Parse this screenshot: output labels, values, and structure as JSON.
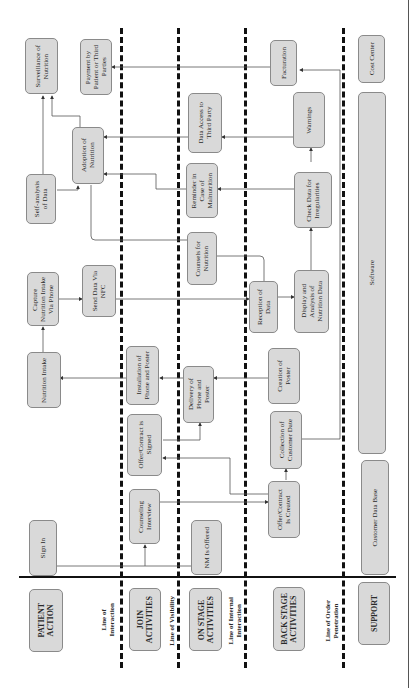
{
  "diagram": {
    "type": "service-blueprint",
    "orientation": "rotated-90-ccw",
    "lanes": [
      {
        "id": "patient",
        "label": "PATIENT\nACTION"
      },
      {
        "id": "join",
        "label": "JOIN\nACTIVITIES"
      },
      {
        "id": "onstage",
        "label": "ON STAGE\nACTIVITIES"
      },
      {
        "id": "backstage",
        "label": "BACK STAGE\nACTIVITIES"
      },
      {
        "id": "support",
        "label": "SUPPORT"
      }
    ],
    "lines": [
      {
        "label": "Line of\nInteraction"
      },
      {
        "label": "Line of Visibility"
      },
      {
        "label": "Line of Internal\nInteraction"
      },
      {
        "label": "Line of Order\nPenetration"
      }
    ],
    "nodes": {
      "sign_in": "Sign In",
      "nutrition_intake": "Nutrition Intake",
      "capture_intake": "Capture\nNutrition Intake\nVia Phone",
      "self_analysis": "Self-analysis\nof Data",
      "surveillance": "Surveillance of\nNutrition",
      "counseling_interview": "Counseling\nInterview",
      "offer_signed": "Offer/Contract is\nSigned",
      "installation": "Installation of\nPhone and Poster",
      "send_nfc": "Send Data Via\nNFC",
      "adoption": "Adoption of\nNutrition",
      "payment": "Payment by\nPatient or Third\nParties",
      "nm_offered": "NM Is Offered",
      "delivery": "Delivery of\nPhone and\nPoster",
      "counsels": "Counsels for\nNutrition",
      "reminder": "Reminder in\nCase of\nMalnutrition",
      "data_access": "Data Access to\nThird Party",
      "offer_created": "Offer/Contract\nIs Created",
      "collection": "Collection of\nCustomer Date",
      "creation_poster": "Creation of\nPoster",
      "reception": "Reception of\nData",
      "display_analysis": "Display and\nAnalysis of\nNutrition Data",
      "check_data": "Check Data for\nIrregularities",
      "warnings": "Warnings",
      "facturation": "Facturation",
      "customer_db": "Customer Data Base",
      "software": "Software",
      "cost_center": "Cost Center"
    }
  }
}
